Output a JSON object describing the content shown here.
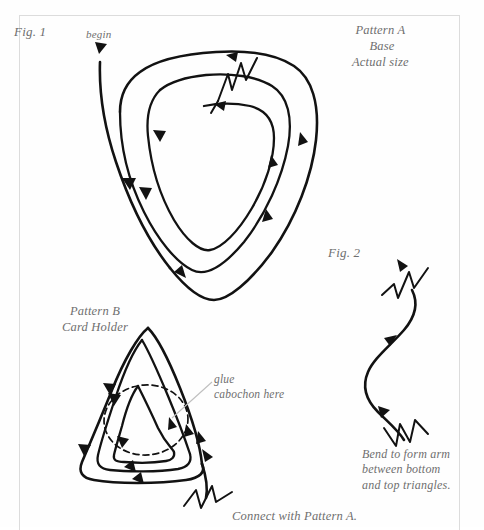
{
  "page": {
    "background_color": "#fefefe",
    "frame_color": "#dcdcdc",
    "ink_color": "#111111",
    "text_color": "#6e6e6e"
  },
  "labels": {
    "fig1": "Fig. 1",
    "fig2": "Fig. 2",
    "begin": "begin",
    "pattern_a": "Pattern A\n Base\nActual size",
    "pattern_b": "Pattern B\nCard Holder",
    "glue": "glue\ncabochon here",
    "bend": "Bend to form arm\nbetween bottom\nand top triangles.",
    "connect": "Connect with Pattern A."
  },
  "figures": {
    "fig1": {
      "name": "Pattern A Base spiral",
      "description": "Three nested rounded-triangle wire coils with directional arrows, a begin arrow at upper left and a zigzag wire terminus at top center",
      "loops": 3,
      "arrow_count": 9,
      "has_zigzag_terminus": true
    },
    "fig2": {
      "name": "Bend arm wire",
      "description": "S-shaped wire segment with zigzag crimps at both ends and two directional arrows",
      "arrow_count": 2,
      "zigzag_ends": 2
    },
    "fig3": {
      "name": "Pattern B Card Holder spiral",
      "description": "Three nested pointed-triangle wire coils with a dashed oval marking cabochon placement and a zigzag wire tail at lower right",
      "loops": 3,
      "arrow_count": 9,
      "has_dashed_oval": true,
      "has_zigzag_terminus": true
    }
  }
}
